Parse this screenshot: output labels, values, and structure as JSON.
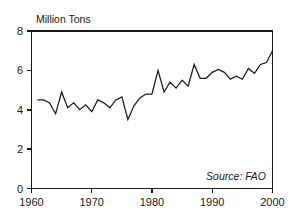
{
  "chart_data": {
    "type": "line",
    "title": "",
    "ylabel": "Million Tons",
    "xlabel": "",
    "xlim": [
      1960,
      2000
    ],
    "ylim": [
      0,
      8
    ],
    "grid": false,
    "legend": null,
    "annotation": "Source:  FAO",
    "source_label": "Source:",
    "source_value": "FAO",
    "x_ticks": [
      "1960",
      "1970",
      "1980",
      "1990",
      "2000"
    ],
    "x_tick_values": [
      1960,
      1970,
      1980,
      1990,
      2000
    ],
    "y_ticks": [
      "0",
      "2",
      "4",
      "6",
      "8"
    ],
    "y_tick_values": [
      0,
      2,
      4,
      6,
      8
    ],
    "x": [
      1961,
      1962,
      1963,
      1964,
      1965,
      1966,
      1967,
      1968,
      1969,
      1970,
      1971,
      1972,
      1973,
      1974,
      1975,
      1976,
      1977,
      1978,
      1979,
      1980,
      1981,
      1982,
      1983,
      1984,
      1985,
      1986,
      1987,
      1988,
      1989,
      1990,
      1991,
      1992,
      1993,
      1994,
      1995,
      1996,
      1997,
      1998,
      1999,
      2000
    ],
    "values": [
      4.5,
      4.5,
      4.35,
      3.8,
      4.9,
      4.1,
      4.35,
      4.0,
      4.25,
      3.9,
      4.5,
      4.35,
      4.1,
      4.5,
      4.65,
      3.5,
      4.2,
      4.6,
      4.8,
      4.8,
      6.0,
      4.9,
      5.4,
      5.1,
      5.5,
      5.2,
      6.3,
      5.6,
      5.6,
      5.9,
      6.05,
      5.9,
      5.55,
      5.7,
      5.55,
      6.1,
      5.85,
      6.3,
      6.4,
      7.0
    ],
    "series": [
      {
        "name": "Million Tons",
        "color": "#1a1a1a",
        "values": [
          4.5,
          4.5,
          4.35,
          3.8,
          4.9,
          4.1,
          4.35,
          4.0,
          4.25,
          3.9,
          4.5,
          4.35,
          4.1,
          4.5,
          4.65,
          3.5,
          4.2,
          4.6,
          4.8,
          4.8,
          6.0,
          4.9,
          5.4,
          5.1,
          5.5,
          5.2,
          6.3,
          5.6,
          5.6,
          5.9,
          6.05,
          5.9,
          5.55,
          5.7,
          5.55,
          6.1,
          5.85,
          6.3,
          6.4,
          7.0
        ]
      }
    ],
    "colors": {
      "line": "#1a1a1a",
      "axis": "#1a1a1a",
      "background": "#ffffff",
      "text": "#1a1a1a"
    }
  }
}
